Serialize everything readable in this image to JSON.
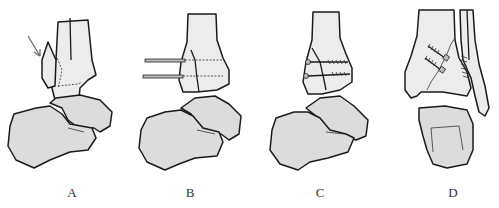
{
  "figure": {
    "panels": [
      {
        "id": "A",
        "label": "A",
        "view": "lateral",
        "description": "Ankle with displaced medial malleolus fragment; arrow indicating force direction; dashed fracture lines"
      },
      {
        "id": "B",
        "label": "B",
        "view": "lateral",
        "description": "Fragment reduced and fixed with two parallel K-wires (dashed inside bone)"
      },
      {
        "id": "C",
        "label": "C",
        "view": "lateral",
        "description": "Fragment fixed with two cannulated lag screws"
      },
      {
        "id": "D",
        "label": "D",
        "view": "anteroposterior",
        "description": "AP view with two oblique screws across irregular fracture line and fibular fixation"
      }
    ],
    "colors": {
      "bone_fill": "#dcdcdc",
      "outline": "#1a1a1a",
      "arrow": "#666666",
      "background": "#ffffff"
    }
  }
}
